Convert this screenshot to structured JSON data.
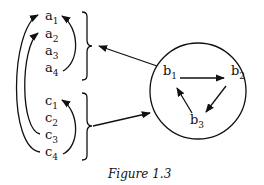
{
  "figure": {
    "caption": "Figure 1.3",
    "group_a": {
      "elements": [
        {
          "base": "a",
          "sub": "1"
        },
        {
          "base": "a",
          "sub": "2"
        },
        {
          "base": "a",
          "sub": "3"
        },
        {
          "base": "a",
          "sub": "4"
        }
      ]
    },
    "group_c": {
      "elements": [
        {
          "base": "c",
          "sub": "1"
        },
        {
          "base": "c",
          "sub": "2"
        },
        {
          "base": "c",
          "sub": "3"
        },
        {
          "base": "c",
          "sub": "4"
        }
      ]
    },
    "group_b": {
      "shape": "circle",
      "elements": [
        {
          "base": "b",
          "sub": "1"
        },
        {
          "base": "b",
          "sub": "2"
        },
        {
          "base": "b",
          "sub": "3"
        }
      ]
    },
    "arrows": [
      {
        "from": "c4",
        "to": "a1",
        "side": "left-outer"
      },
      {
        "from": "c3",
        "to": "a2",
        "side": "left-inner"
      },
      {
        "from": "a4",
        "to": "a1",
        "side": "right"
      },
      {
        "from": "c4",
        "to": "c1",
        "side": "right"
      },
      {
        "from": "b1",
        "to": "b2"
      },
      {
        "from": "b2",
        "to": "b3"
      },
      {
        "from": "b3",
        "to": "b1"
      },
      {
        "from": "circle-b",
        "to": "brace-a"
      },
      {
        "from": "brace-c",
        "to": "circle-b"
      }
    ],
    "colors": {
      "ink": "#111111",
      "background": "#ffffff"
    }
  }
}
